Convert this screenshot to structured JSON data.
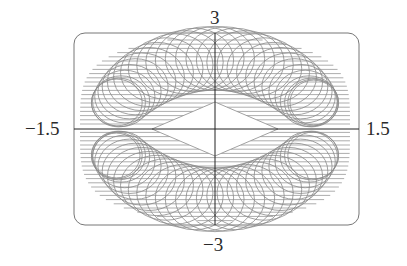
{
  "chart_data": {
    "type": "line",
    "subtype": "parametric-curve",
    "title": "",
    "xlabel": "",
    "ylabel": "",
    "xlim": [
      -1.5,
      1.5
    ],
    "ylim": [
      -3,
      3
    ],
    "tick_labels": {
      "x_left": "−1.5",
      "x_right": "1.5",
      "y_top": "3",
      "y_bottom": "−3"
    },
    "grid": false,
    "legend": null,
    "frame": "rounded-rectangle",
    "curve_color": "#8a8a8a",
    "axis_color": "#222222",
    "frame_color": "#777777",
    "shape": {
      "outer_x_extent": [
        -1.45,
        1.45
      ],
      "outer_y_extent": [
        -2.9,
        2.9
      ],
      "inner_hole_x_extent": [
        -0.75,
        0.75
      ],
      "inner_hole_y_extent": [
        -0.85,
        0.85
      ],
      "loops": 60
    }
  }
}
